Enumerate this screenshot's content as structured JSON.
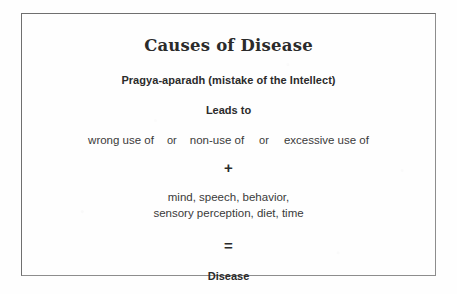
{
  "figure": {
    "title": "Causes of Disease",
    "subtitle": "Pragya-aparadh (mistake of the Intellect)",
    "leads_to": "Leads to",
    "uses": {
      "first": "wrong use of",
      "or_1": "or",
      "second": "non-use of",
      "or_2": "or",
      "third": "excessive use of"
    },
    "plus_operator": "+",
    "factors": {
      "line_1": "mind, speech, behavior,",
      "line_2": "sensory perception, diet, time"
    },
    "equals_operator": "=",
    "result": "Disease"
  },
  "style": {
    "border_color": "#8d8d8d",
    "text_color": "#2b2b2b",
    "body_text_color": "#3a3a3a",
    "page_background": "#fefefe"
  }
}
